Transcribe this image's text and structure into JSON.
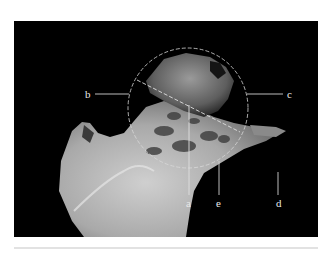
{
  "figure": {
    "background_color": "#000000",
    "overlay_color": "#d8d8d8",
    "labels": {
      "a": "a",
      "b": "b",
      "c": "c",
      "d": "d",
      "e": "e"
    }
  }
}
